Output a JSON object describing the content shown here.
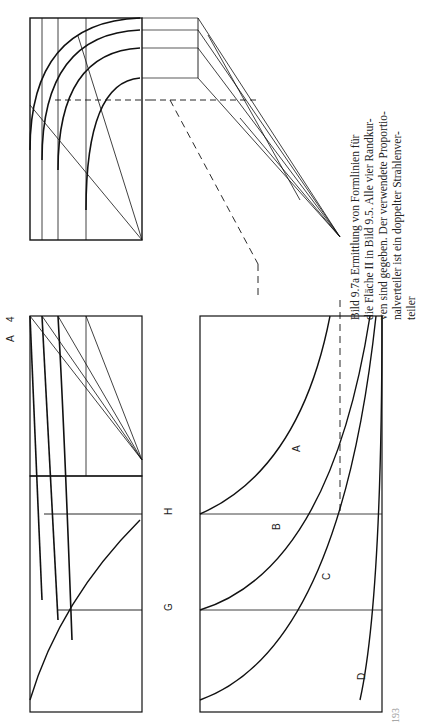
{
  "figure": {
    "caption_lines": [
      "Bild 9.7a   Ermittlung von Formlinien für",
      "die Fläche II in Bild 9.5. Alle vier Randkur-",
      "ven sind gegeben. Der verwendete Proportio-",
      "nalverteiler ist ein doppelter Strahlenver-",
      "teiler"
    ],
    "curve_labels": [
      "A",
      "B",
      "C",
      "D"
    ],
    "section_labels": [
      "G",
      "H"
    ],
    "point_labels": [
      "1",
      "2",
      "3",
      "4"
    ],
    "circled_labels": [
      "1",
      "2",
      "4",
      "5"
    ],
    "page_number": "193"
  }
}
